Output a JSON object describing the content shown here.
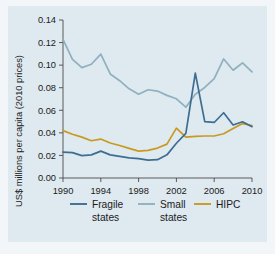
{
  "figure": {
    "background_color": "#dfe9f0",
    "outer_color": "#f2f6f9"
  },
  "chart_data": {
    "type": "line",
    "title": "",
    "subtitle": "",
    "xlabel": "",
    "ylabel": "US$ millions per capita (2010 prices)",
    "xlim": [
      1990,
      2010
    ],
    "ylim": [
      0.0,
      0.14
    ],
    "grid": false,
    "legend_position": "bottom",
    "x": [
      1990,
      1991,
      1992,
      1993,
      1994,
      1995,
      1996,
      1997,
      1998,
      1999,
      2000,
      2001,
      2002,
      2003,
      2004,
      2005,
      2006,
      2007,
      2008,
      2009,
      2010
    ],
    "xticks": [
      1990,
      1994,
      1998,
      2002,
      2006,
      2010
    ],
    "xticklabels": [
      "1990",
      "1994",
      "1998",
      "2002",
      "2006",
      "2010"
    ],
    "yticks": [
      0.0,
      0.02,
      0.04,
      0.06,
      0.08,
      0.1,
      0.12,
      0.14
    ],
    "yticklabels": [
      "0.00",
      "0.02",
      "0.04",
      "0.06",
      "0.08",
      "0.10",
      "0.12",
      "0.14"
    ],
    "series": [
      {
        "name": "Fragile states",
        "color": "#3d6e92",
        "values": [
          0.023,
          0.0225,
          0.0198,
          0.0205,
          0.0238,
          0.0205,
          0.0192,
          0.0178,
          0.0172,
          0.0158,
          0.0162,
          0.0205,
          0.0308,
          0.0395,
          0.093,
          0.05,
          0.0492,
          0.0578,
          0.047,
          0.0498,
          0.0455
        ]
      },
      {
        "name": "Small states",
        "color": "#8fb0bf",
        "values": [
          0.1228,
          0.1052,
          0.0978,
          0.1008,
          0.1098,
          0.0922,
          0.0862,
          0.079,
          0.0742,
          0.0782,
          0.077,
          0.0732,
          0.0702,
          0.0628,
          0.0742,
          0.0802,
          0.088,
          0.1055,
          0.0955,
          0.102,
          0.094
        ]
      },
      {
        "name": "HIPC",
        "color": "#c99a21",
        "values": [
          0.042,
          0.0388,
          0.0362,
          0.033,
          0.0345,
          0.031,
          0.0288,
          0.0262,
          0.0238,
          0.0245,
          0.0265,
          0.03,
          0.0442,
          0.0362,
          0.0368,
          0.0372,
          0.0372,
          0.0392,
          0.0438,
          0.0482,
          0.0465
        ]
      }
    ]
  },
  "legend": {
    "items": [
      {
        "label_line1": "Fragile",
        "label_line2": "states",
        "color": "#3d6e92"
      },
      {
        "label_line1": "Small",
        "label_line2": "states",
        "color": "#8fb0bf"
      },
      {
        "label_line1": "HIPC",
        "label_line2": "",
        "color": "#c99a21"
      }
    ]
  }
}
